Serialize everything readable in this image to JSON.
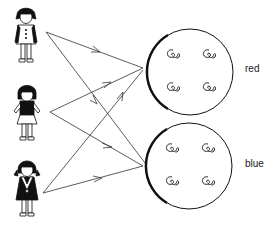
{
  "diagram": {
    "figures": [
      {
        "id": "girl-1",
        "outfit": "white dress with black sleeves and buttons"
      },
      {
        "id": "girl-2",
        "outfit": "black top with white skirt"
      },
      {
        "id": "girl-3",
        "outfit": "black dress with white collar, pigtails"
      }
    ],
    "groups": [
      {
        "id": "group-red",
        "label": "red",
        "items": 4
      },
      {
        "id": "group-blue",
        "label": "blue",
        "items": 4
      }
    ],
    "arrows": [
      {
        "from": "girl-1",
        "to": "group-red"
      },
      {
        "from": "girl-1",
        "to": "group-blue"
      },
      {
        "from": "girl-2",
        "to": "group-red"
      },
      {
        "from": "girl-2",
        "to": "group-blue"
      },
      {
        "from": "girl-3",
        "to": "group-red"
      },
      {
        "from": "girl-3",
        "to": "group-blue"
      }
    ],
    "colors": {
      "ink": "#111111",
      "background": "#ffffff"
    }
  }
}
